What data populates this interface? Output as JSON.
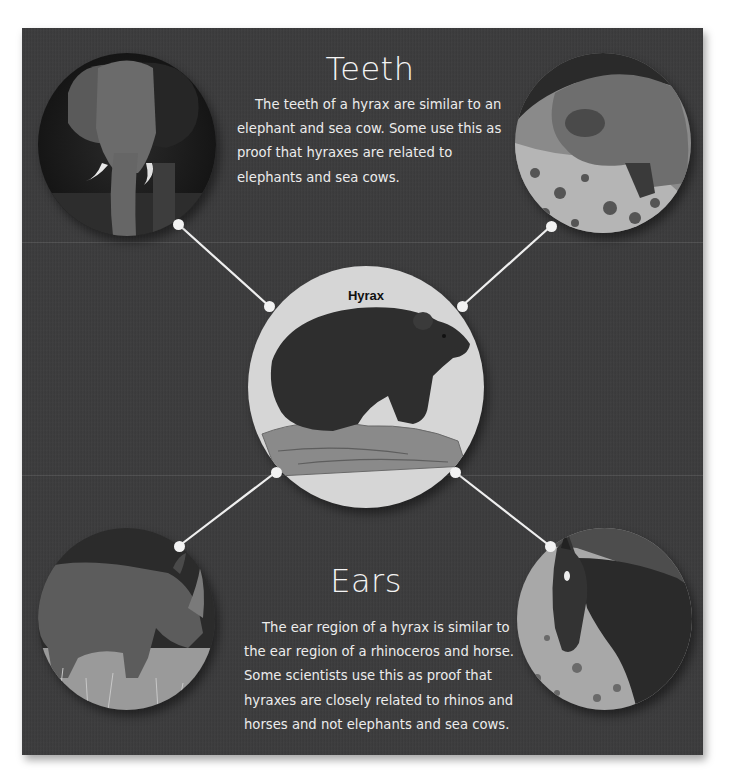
{
  "center": {
    "label": "Hyrax",
    "image": "hyrax-photo"
  },
  "sections": {
    "teeth": {
      "title": "Teeth",
      "body": "The teeth of a hyrax are similar to an elephant and sea cow.  Some use this as proof that hyraxes are related to elephants and sea cows.",
      "related": [
        "elephant-photo",
        "sea-cow-photo"
      ]
    },
    "ears": {
      "title": "Ears",
      "body": "The ear region of a hyrax is similar to the ear region of a rhinoceros and horse. Some scientists use this as proof that hyraxes are closely related to rhinos and horses and not elephants and sea cows.",
      "related": [
        "rhinoceros-photo",
        "horse-photo"
      ]
    }
  },
  "colors": {
    "panel_background": "#3b3b3c",
    "page_background": "#ffffff",
    "text": "#f0f0f0",
    "connector": "#f2f2f2",
    "hub_background": "#d6d6d6"
  }
}
